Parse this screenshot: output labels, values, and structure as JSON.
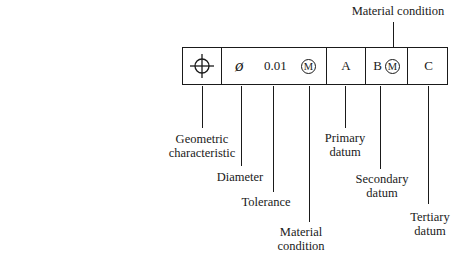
{
  "diagram": {
    "title_label": "Material condition",
    "frame_cells": [
      {
        "id": "geometric",
        "icon": "position-icon"
      },
      {
        "id": "tolerance",
        "diameter_symbol": "ø",
        "value": "0.01",
        "modifier": "M"
      },
      {
        "id": "primary",
        "text": "A"
      },
      {
        "id": "secondary",
        "text": "B",
        "modifier": "M"
      },
      {
        "id": "tertiary",
        "text": "C"
      }
    ],
    "labels": {
      "geometric_1": "Geometric",
      "geometric_2": "characteristic",
      "diameter": "Diameter",
      "tolerance": "Tolerance",
      "material_1": "Material",
      "material_2": "condition",
      "primary_1": "Primary",
      "primary_2": "datum",
      "secondary_1": "Secondary",
      "secondary_2": "datum",
      "tertiary_1": "Tertiary",
      "tertiary_2": "datum"
    }
  }
}
